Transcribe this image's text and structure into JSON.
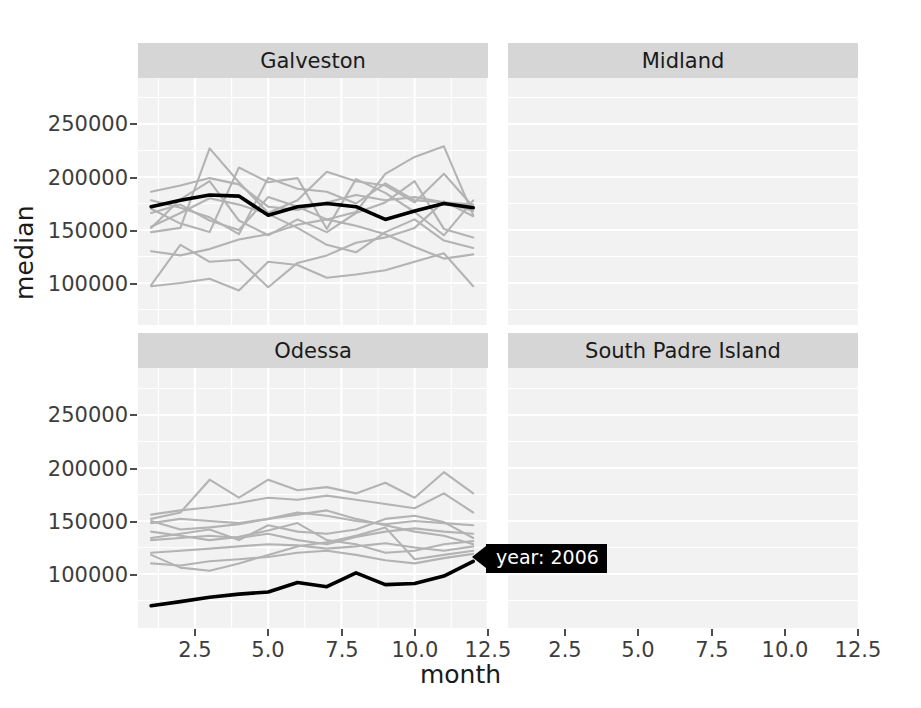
{
  "chart_data": {
    "type": "line",
    "title": "",
    "xlabel": "month",
    "ylabel": "median",
    "xlim": [
      1,
      12
    ],
    "ylim": [
      60000,
      285000
    ],
    "xticks": [
      2.5,
      5.0,
      7.5,
      10.0,
      12.5
    ],
    "xtick_labels": [
      "2.5",
      "5.0",
      "7.5",
      "10.0",
      "12.5"
    ],
    "yticks": [
      100000,
      150000,
      200000,
      250000
    ],
    "ytick_labels": [
      "100000",
      "150000",
      "200000",
      "250000"
    ],
    "grid": true,
    "legend": "none",
    "facet_labels": [
      "Galveston",
      "Midland",
      "Odessa",
      "South Padre Island"
    ],
    "highlight": {
      "label": "year: 2006",
      "color": "#000000",
      "annotation_panel": "Odessa"
    },
    "background_series_color": "#b3b3b3",
    "panels": [
      {
        "name": "Galveston",
        "x": [
          1,
          2,
          3,
          4,
          5,
          6,
          7,
          8,
          9,
          10,
          11,
          12
        ],
        "highlight_series": {
          "name": "2006",
          "values": [
            172000,
            178000,
            183000,
            182000,
            164000,
            172000,
            175000,
            172000,
            160000,
            168000,
            175000,
            171000,
            158000
          ]
        },
        "series": [
          {
            "name": "2000",
            "values": [
              186000,
              192000,
              199000,
              193000,
              172000,
              169000,
              176000,
              183000,
              178000,
              181000,
              176000,
              168000
            ]
          },
          {
            "name": "2001",
            "values": [
              148000,
              152000,
              227000,
              195000,
              166000,
              178000,
              205000,
              196000,
              192000,
              176000,
              203000,
              172000
            ]
          },
          {
            "name": "2002",
            "values": [
              152000,
              179000,
              196000,
              159000,
              145000,
              160000,
              148000,
              166000,
              176000,
              196000,
              151000,
              143000
            ]
          },
          {
            "name": "2003",
            "values": [
              98000,
              136000,
              120000,
              122000,
              96000,
              119000,
              126000,
              138000,
              143000,
              152000,
              177000,
              163000
            ]
          },
          {
            "name": "2004",
            "values": [
              170000,
              156000,
              148000,
              209000,
              195000,
              199000,
              151000,
              198000,
              185000,
              167000,
              145000,
              178000
            ]
          },
          {
            "name": "2005",
            "values": [
              130000,
              126000,
              132000,
              141000,
              146000,
              155000,
              160000,
              154000,
              146000,
              134000,
              123000,
              127000
            ]
          },
          {
            "name": "2007",
            "values": [
              97000,
              100000,
              104000,
              93000,
              120000,
              117000,
              105000,
              108000,
              112000,
              120000,
              128000,
              97000
            ]
          },
          {
            "name": "2008",
            "values": [
              178000,
              171000,
              162000,
              146000,
              199000,
              189000,
              186000,
              175000,
              194000,
              178000,
              176000,
              174000
            ]
          },
          {
            "name": "2009",
            "values": [
              166000,
              174000,
              159000,
              150000,
              181000,
              172000,
              160000,
              167000,
              203000,
              219000,
              229000,
              164000
            ]
          },
          {
            "name": "2010",
            "values": [
              153000,
              166000,
              180000,
              174000,
              165000,
              152000,
              136000,
              129000,
              148000,
              160000,
              140000,
              133000
            ]
          }
        ]
      },
      {
        "name": "Midland",
        "x": [
          1,
          2,
          3,
          4,
          5,
          6,
          7,
          8,
          9,
          10,
          11,
          12
        ],
        "highlight_series": {
          "name": "2006",
          "values": [
            null,
            null,
            null,
            124000,
            130000,
            139000,
            131000,
            130000,
            127000,
            121000,
            141000,
            136000,
            137000
          ]
        },
        "series": [
          {
            "name": "2000",
            "values": [
              233000,
              228000,
              236000,
              240000,
              252000,
              278000,
              224000,
              222000,
              232000,
              247000,
              230000,
              236000
            ]
          },
          {
            "name": "2001",
            "values": [
              229000,
              246000,
              231000,
              211000,
              217000,
              226000,
              234000,
              238000,
              240000,
              220000,
              251000,
              236000
            ]
          },
          {
            "name": "2002",
            "values": [
              186000,
              191000,
              196000,
              207000,
              219000,
              228000,
              230000,
              234000,
              233000,
              221000,
              216000,
              211000
            ]
          },
          {
            "name": "2003",
            "values": [
              180000,
              178000,
              177000,
              180000,
              188000,
              194000,
              196000,
              204000,
              210000,
              221000,
              205000,
              196000
            ]
          },
          {
            "name": "2004",
            "values": [
              178000,
              196000,
              172000,
              175000,
              183000,
              178000,
              174000,
              180000,
              170000,
              168000,
              178000,
              176000
            ]
          },
          {
            "name": "2005",
            "values": [
              172000,
              166000,
              176000,
              178000,
              175000,
              181000,
              196000,
              186000,
              176000,
              167000,
              182000,
              176000
            ]
          },
          {
            "name": "2007",
            "values": [
              171000,
              170000,
              168000,
              170000,
              172000,
              174000,
              178000,
              176000,
              172000,
              170000,
              166000,
              172000
            ]
          },
          {
            "name": "2008",
            "values": [
              170000,
              163000,
              167000,
              170000,
              169000,
              172000,
              175000,
              173000,
              170000,
              167000,
              159000,
              171000
            ]
          },
          {
            "name": "2009",
            "values": [
              168000,
              147000,
              178000,
              194000,
              214000,
              236000,
              196000,
              183000,
              170000,
              167000,
              172000,
              171000
            ]
          },
          {
            "name": "2010",
            "values": [
              152000,
              144000,
              158000,
              168000,
              164000,
              160000,
              164000,
              168000,
              170000,
              161000,
              176000,
              168000
            ]
          }
        ]
      },
      {
        "name": "Odessa",
        "x": [
          1,
          2,
          3,
          4,
          5,
          6,
          7,
          8,
          9,
          10,
          11,
          12
        ],
        "highlight_series": {
          "name": "2006",
          "values": [
            70000,
            74000,
            78000,
            81000,
            83000,
            92000,
            88000,
            101000,
            90000,
            91000,
            98000,
            112000
          ]
        },
        "series": [
          {
            "name": "2000",
            "values": [
              152000,
              158000,
              189000,
              172000,
              189000,
              179000,
              182000,
              176000,
              186000,
              172000,
              196000,
              176000
            ]
          },
          {
            "name": "2001",
            "values": [
              156000,
              160000,
              163000,
              167000,
              172000,
              170000,
              174000,
              170000,
              166000,
              162000,
              176000,
              158000
            ]
          },
          {
            "name": "2002",
            "values": [
              148000,
              152000,
              150000,
              148000,
              152000,
              158000,
              155000,
              150000,
              147000,
              150000,
              148000,
              146000
            ]
          },
          {
            "name": "2003",
            "values": [
              134000,
              138000,
              142000,
              132000,
              146000,
              140000,
              138000,
              142000,
              152000,
              155000,
              149000,
              134000
            ]
          },
          {
            "name": "2004",
            "values": [
              132000,
              134000,
              136000,
              134000,
              138000,
              132000,
              128000,
              135000,
              140000,
              143000,
              140000,
              138000
            ]
          },
          {
            "name": "2005",
            "values": [
              120000,
              122000,
              124000,
              126000,
              128000,
              127000,
              124000,
              126000,
              129000,
              125000,
              122000,
              126000
            ]
          },
          {
            "name": "2007",
            "values": [
              110000,
              108000,
              112000,
              114000,
              116000,
              120000,
              122000,
              118000,
              113000,
              110000,
              115000,
              119000
            ]
          },
          {
            "name": "2008",
            "values": [
              118000,
              106000,
              103000,
              110000,
              118000,
              126000,
              130000,
              136000,
              144000,
              114000,
              118000,
              122000
            ]
          },
          {
            "name": "2009",
            "values": [
              140000,
              136000,
              132000,
              135000,
              141000,
              148000,
              132000,
              128000,
              120000,
              122000,
              128000,
              131000
            ]
          },
          {
            "name": "2010",
            "values": [
              150000,
              142000,
              144000,
              147000,
              152000,
              156000,
              160000,
              152000,
              146000,
              140000,
              136000,
              128000
            ]
          }
        ]
      },
      {
        "name": "South Padre Island",
        "x": [
          1,
          2,
          3,
          4,
          5,
          6,
          7,
          8,
          9,
          10,
          11,
          12
        ],
        "highlight_series": {
          "name": "2006",
          "values": []
        },
        "series": [
          {
            "name": "2000",
            "values": [
              214000,
              248000,
              176000,
              132000,
              190000,
              158000,
              202000,
              176000,
              204000,
              150000,
              238000,
              166000
            ]
          },
          {
            "name": "2001",
            "values": [
              186000,
              232000,
              146000,
              198000,
              164000,
              178000,
              252000,
              196000,
              168000,
              182000,
              158000,
              176000
            ]
          },
          {
            "name": "2002",
            "values": [
              238000,
              178000,
              134000,
              172000,
              148000,
              176000,
              166000,
              190000,
              254000,
              162000,
              206000,
              182000
            ]
          },
          {
            "name": "2003",
            "values": [
              162000,
              196000,
              202000,
              166000,
              178000,
              156000,
              186000,
              172000,
              168000,
              126000,
              176000,
              198000
            ]
          },
          {
            "name": "2004",
            "values": [
              172000,
              150000,
              188000,
              106000,
              162000,
              192000,
              176000,
              170000,
              158000,
              128000,
              142000,
              134000
            ]
          },
          {
            "name": "2005",
            "values": [
              180000,
              172000,
              158000,
              118000,
              136000,
              170000,
              180000,
              160000,
              184000,
              134000,
              228000,
              176000
            ]
          },
          {
            "name": "2007",
            "values": [
              206000,
              164000,
              180000,
              176000,
              158000,
              172000,
              162000,
              166000,
              176000,
              180000,
              160000,
              224000
            ]
          }
        ]
      }
    ]
  },
  "labels": {
    "axis_y": "median",
    "axis_x": "month"
  }
}
